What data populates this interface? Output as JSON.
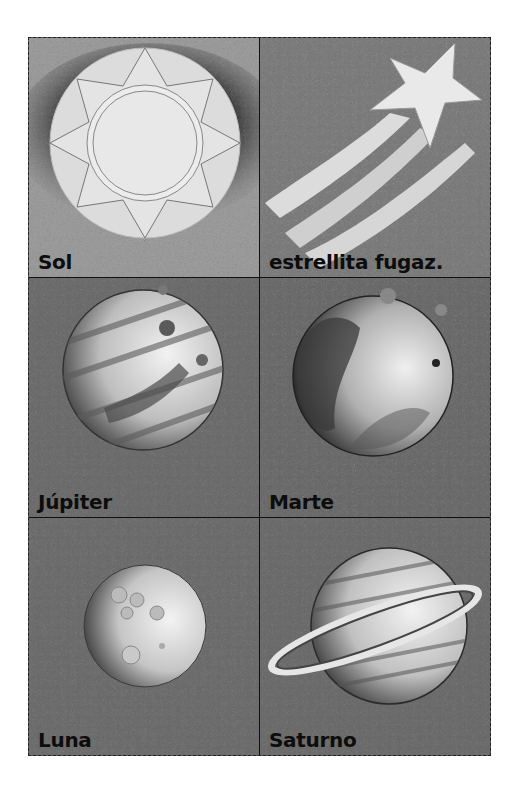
{
  "sheet": {
    "title": "",
    "cards": [
      {
        "label": "Sol",
        "icon": "sun-icon",
        "bg": "#8c8c8c"
      },
      {
        "label": "estrellita fugaz.",
        "icon": "shooting-star-icon",
        "bg": "#6e6e6e"
      },
      {
        "label": "Júpiter",
        "icon": "jupiter-icon",
        "bg": "#6a6a6a"
      },
      {
        "label": "Marte",
        "icon": "mars-icon",
        "bg": "#666666"
      },
      {
        "label": "Luna",
        "icon": "moon-icon",
        "bg": "#686868"
      },
      {
        "label": "Saturno",
        "icon": "saturn-icon",
        "bg": "#676767"
      }
    ]
  },
  "colors": {
    "divider": "#111111",
    "label_text": "#0d0d0d",
    "highlight": "#e8e8e8"
  }
}
